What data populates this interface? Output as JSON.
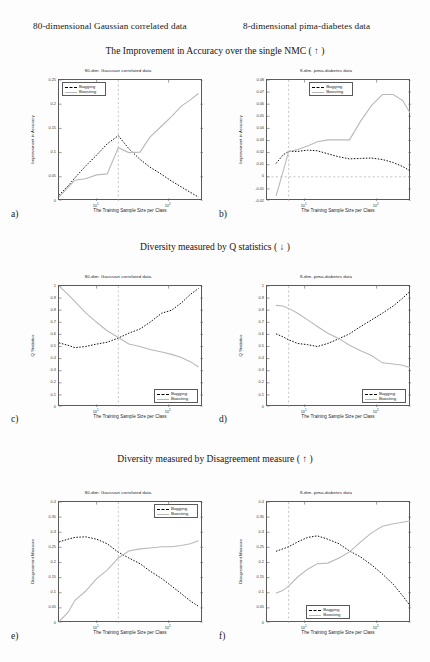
{
  "column_headers": [
    {
      "text": "80-dimensional Gaussian correlated data"
    },
    {
      "text": "8-dimensional pima-diabetes data"
    }
  ],
  "section_headers": [
    {
      "text": "The Improvement in Accuracy over the single NMC ( ↑ )"
    },
    {
      "text": "Diversity measured by Q statistics ( ↓ )"
    },
    {
      "text": "Diversity measured by Disagreement measure ( ↑ )"
    }
  ],
  "panel_letters": [
    "a)",
    "b)",
    "c)",
    "d)",
    "e)",
    "f)"
  ],
  "legend": {
    "bagging": "Bagging",
    "boosting": "Boosting"
  },
  "colors": {
    "bagging": "#000000",
    "boosting": "#b9b9b9",
    "axis": "#5a5a5a",
    "grid": "#aaaaaa"
  },
  "chart_data": [
    {
      "id": "a",
      "type": "line",
      "title": "80-dim. Gaussian correlated data",
      "xlabel": "The Training Sample Size per Class",
      "ylabel": "Improvement in Accuracy",
      "xscale": "log",
      "xlim": [
        3,
        300
      ],
      "ylim": [
        0,
        0.25
      ],
      "yticks": [
        0,
        0.05,
        0.1,
        0.15,
        0.2,
        0.25
      ],
      "ytick_labels": [
        "0",
        "0.05",
        "0.1",
        "0.15",
        "0.2",
        "0.25"
      ],
      "xticks": [
        10,
        100
      ],
      "xtick_labels": [
        "10^1",
        "10^2"
      ],
      "vline_x": 20,
      "grid": false,
      "legend_position": "top-left",
      "series": [
        {
          "name": "Bagging",
          "style": "dashed",
          "x": [
            3,
            4,
            5,
            7,
            10,
            14,
            20,
            28,
            40,
            55,
            80,
            110,
            150,
            200,
            260
          ],
          "y": [
            0.012,
            0.031,
            0.048,
            0.072,
            0.095,
            0.118,
            0.135,
            0.108,
            0.086,
            0.07,
            0.055,
            0.041,
            0.029,
            0.018,
            0.008
          ]
        },
        {
          "name": "Boosting",
          "style": "solid",
          "x": [
            3,
            4,
            5,
            7,
            10,
            14,
            20,
            28,
            40,
            55,
            80,
            110,
            150,
            200,
            260
          ],
          "y": [
            0.008,
            0.028,
            0.043,
            0.046,
            0.054,
            0.056,
            0.11,
            0.1,
            0.101,
            0.132,
            0.155,
            0.175,
            0.196,
            0.209,
            0.222
          ]
        }
      ]
    },
    {
      "id": "b",
      "type": "line",
      "title": "8-dim. pima-diabetes data",
      "xlabel": "The Training Sample Size per Class",
      "ylabel": "Improvement in Accuracy",
      "xscale": "log",
      "xlim": [
        3,
        300
      ],
      "ylim": [
        -0.02,
        0.08
      ],
      "yticks": [
        -0.02,
        -0.01,
        0,
        0.01,
        0.02,
        0.03,
        0.04,
        0.05,
        0.06,
        0.07,
        0.08
      ],
      "ytick_labels": [
        "-0.02",
        "-0.01",
        "0",
        "0.01",
        "0.02",
        "0.03",
        "0.04",
        "0.05",
        "0.06",
        "0.07",
        "0.08"
      ],
      "xticks": [
        10,
        100
      ],
      "xtick_labels": [
        "10^1",
        "10^2"
      ],
      "vline_x": 6,
      "hline_y": 0,
      "grid": false,
      "legend_position": "top-center",
      "series": [
        {
          "name": "Bagging",
          "style": "dashed",
          "x": [
            4,
            5,
            6,
            8,
            11,
            15,
            21,
            30,
            42,
            60,
            85,
            120,
            170,
            230,
            290
          ],
          "y": [
            0.011,
            0.018,
            0.021,
            0.021,
            0.022,
            0.0215,
            0.019,
            0.0165,
            0.0148,
            0.0152,
            0.0155,
            0.0143,
            0.0118,
            0.0085,
            0.005
          ]
        },
        {
          "name": "Boosting",
          "style": "solid",
          "x": [
            4,
            5,
            6,
            8,
            11,
            15,
            21,
            30,
            42,
            60,
            85,
            120,
            170,
            230,
            290
          ],
          "y": [
            -0.016,
            0.004,
            0.021,
            0.0225,
            0.0255,
            0.029,
            0.0305,
            0.0305,
            0.0305,
            0.046,
            0.059,
            0.068,
            0.068,
            0.063,
            0.053
          ]
        }
      ]
    },
    {
      "id": "c",
      "type": "line",
      "title": "80-dim. Gaussian correlated data",
      "xlabel": "The Training Sample Size per Class",
      "ylabel": "Q Statistics",
      "xscale": "log",
      "xlim": [
        3,
        300
      ],
      "ylim": [
        0,
        1
      ],
      "yticks": [
        0,
        0.1,
        0.2,
        0.3,
        0.4,
        0.5,
        0.6,
        0.7,
        0.8,
        0.9,
        1
      ],
      "ytick_labels": [
        "0",
        "0.1",
        "0.2",
        "0.3",
        "0.4",
        "0.5",
        "0.6",
        "0.7",
        "0.8",
        "0.9",
        "1"
      ],
      "xticks": [
        10,
        100
      ],
      "xtick_labels": [
        "10^1",
        "10^2"
      ],
      "vline_x": 20,
      "grid": false,
      "legend_position": "bottom-right",
      "series": [
        {
          "name": "Bagging",
          "style": "dashed",
          "x": [
            3,
            4,
            5,
            7,
            10,
            14,
            20,
            28,
            40,
            55,
            80,
            110,
            150,
            200,
            260
          ],
          "y": [
            0.53,
            0.51,
            0.49,
            0.5,
            0.52,
            0.535,
            0.57,
            0.61,
            0.645,
            0.7,
            0.775,
            0.8,
            0.86,
            0.93,
            0.98
          ]
        },
        {
          "name": "Boosting",
          "style": "solid",
          "x": [
            3,
            4,
            5,
            7,
            10,
            14,
            20,
            28,
            40,
            55,
            80,
            110,
            150,
            200,
            260
          ],
          "y": [
            1.0,
            0.93,
            0.87,
            0.78,
            0.7,
            0.63,
            0.575,
            0.52,
            0.5,
            0.475,
            0.455,
            0.435,
            0.41,
            0.375,
            0.33
          ]
        }
      ]
    },
    {
      "id": "d",
      "type": "line",
      "title": "8-dim. pima-diabetes data",
      "xlabel": "The Training Sample Size per Class",
      "ylabel": "Q Statistics",
      "xscale": "log",
      "xlim": [
        3,
        300
      ],
      "ylim": [
        0,
        1
      ],
      "yticks": [
        0,
        0.1,
        0.2,
        0.3,
        0.4,
        0.5,
        0.6,
        0.7,
        0.8,
        0.9,
        1
      ],
      "ytick_labels": [
        "0",
        "0.1",
        "0.2",
        "0.3",
        "0.4",
        "0.5",
        "0.6",
        "0.7",
        "0.8",
        "0.9",
        "1"
      ],
      "xticks": [
        10,
        100
      ],
      "xtick_labels": [
        "10^1",
        "10^2"
      ],
      "vline_x": 6,
      "grid": false,
      "legend_position": "bottom-right",
      "series": [
        {
          "name": "Bagging",
          "style": "dashed",
          "x": [
            4,
            5,
            6,
            8,
            11,
            15,
            21,
            30,
            42,
            60,
            85,
            120,
            170,
            230,
            290
          ],
          "y": [
            0.605,
            0.58,
            0.555,
            0.525,
            0.515,
            0.5,
            0.525,
            0.565,
            0.605,
            0.665,
            0.72,
            0.775,
            0.835,
            0.9,
            0.955
          ]
        },
        {
          "name": "Boosting",
          "style": "solid",
          "x": [
            4,
            5,
            6,
            8,
            11,
            15,
            21,
            30,
            42,
            60,
            85,
            120,
            170,
            230,
            290
          ],
          "y": [
            0.84,
            0.835,
            0.815,
            0.775,
            0.72,
            0.665,
            0.61,
            0.565,
            0.51,
            0.465,
            0.425,
            0.365,
            0.355,
            0.345,
            0.325
          ]
        }
      ]
    },
    {
      "id": "e",
      "type": "line",
      "title": "80-dim. Gaussian correlated data",
      "xlabel": "The Training Sample Size per Class",
      "ylabel": "Disagreement Measure",
      "xscale": "log",
      "xlim": [
        3,
        300
      ],
      "ylim": [
        0,
        0.4
      ],
      "yticks": [
        0,
        0.05,
        0.1,
        0.15,
        0.2,
        0.25,
        0.3,
        0.35,
        0.4
      ],
      "ytick_labels": [
        "0",
        "0.05",
        "0.1",
        "0.15",
        "0.2",
        "0.25",
        "0.3",
        "0.35",
        "0.4"
      ],
      "xticks": [
        10,
        100
      ],
      "xtick_labels": [
        "10^1",
        "10^2"
      ],
      "vline_x": 20,
      "grid": false,
      "legend_position": "top-right",
      "series": [
        {
          "name": "Bagging",
          "style": "dashed",
          "x": [
            3,
            4,
            5,
            7,
            10,
            14,
            20,
            28,
            40,
            55,
            80,
            110,
            150,
            200,
            260
          ],
          "y": [
            0.268,
            0.277,
            0.283,
            0.285,
            0.277,
            0.262,
            0.234,
            0.215,
            0.196,
            0.172,
            0.147,
            0.122,
            0.097,
            0.073,
            0.055
          ]
        },
        {
          "name": "Boosting",
          "style": "solid",
          "x": [
            3,
            4,
            5,
            7,
            10,
            14,
            20,
            28,
            40,
            55,
            80,
            110,
            150,
            200,
            260
          ],
          "y": [
            0.005,
            0.035,
            0.075,
            0.105,
            0.147,
            0.175,
            0.215,
            0.238,
            0.245,
            0.248,
            0.252,
            0.252,
            0.256,
            0.262,
            0.272
          ]
        }
      ]
    },
    {
      "id": "f",
      "type": "line",
      "title": "8-dim. pima-diabetes data",
      "xlabel": "The Training Sample Size per Class",
      "ylabel": "Disagreement Measure",
      "xscale": "log",
      "xlim": [
        3,
        300
      ],
      "ylim": [
        0,
        0.4
      ],
      "yticks": [
        0,
        0.05,
        0.1,
        0.15,
        0.2,
        0.25,
        0.3,
        0.35,
        0.4
      ],
      "ytick_labels": [
        "0",
        "0.05",
        "0.1",
        "0.15",
        "0.2",
        "0.25",
        "0.3",
        "0.35",
        "0.4"
      ],
      "xticks": [
        10,
        100
      ],
      "xtick_labels": [
        "10^1",
        "10^2"
      ],
      "vline_x": 6,
      "grid": false,
      "legend_position": "bottom-center",
      "series": [
        {
          "name": "Bagging",
          "style": "dashed",
          "x": [
            4,
            5,
            6,
            8,
            11,
            15,
            21,
            30,
            42,
            60,
            85,
            120,
            170,
            230,
            290
          ],
          "y": [
            0.237,
            0.245,
            0.252,
            0.268,
            0.283,
            0.288,
            0.277,
            0.262,
            0.238,
            0.218,
            0.192,
            0.162,
            0.128,
            0.09,
            0.058
          ]
        },
        {
          "name": "Boosting",
          "style": "solid",
          "x": [
            4,
            5,
            6,
            8,
            11,
            15,
            21,
            30,
            42,
            60,
            85,
            120,
            170,
            230,
            290
          ],
          "y": [
            0.098,
            0.108,
            0.122,
            0.152,
            0.178,
            0.196,
            0.198,
            0.215,
            0.235,
            0.268,
            0.298,
            0.32,
            0.328,
            0.333,
            0.337
          ]
        }
      ]
    }
  ]
}
